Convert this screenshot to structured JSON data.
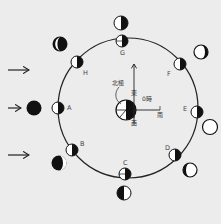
{
  "diagram": {
    "title": "",
    "colors": {
      "background": "#ececec",
      "ink": "#111111",
      "light": "#ffffff"
    },
    "sunlight": {
      "direction": "left-to-right",
      "arrows": 3
    },
    "earth": {
      "north_pole_label": "北極",
      "compass": {
        "up": "東",
        "right": "南",
        "down": "西"
      },
      "time_label": "0時"
    },
    "orbit_positions": [
      {
        "id": "A",
        "label": "A"
      },
      {
        "id": "B",
        "label": "B"
      },
      {
        "id": "C",
        "label": "C"
      },
      {
        "id": "D",
        "label": "D"
      },
      {
        "id": "E",
        "label": "E"
      },
      {
        "id": "F",
        "label": "F"
      },
      {
        "id": "G",
        "label": "G"
      },
      {
        "id": "H",
        "label": "H"
      }
    ]
  }
}
